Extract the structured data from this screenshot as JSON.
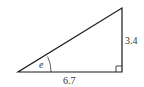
{
  "diagram": {
    "type": "right-triangle",
    "vertices": {
      "left": [
        18,
        72
      ],
      "right_angle": [
        122,
        72
      ],
      "top": [
        122,
        8
      ]
    },
    "stroke_color": "#1a1a1a",
    "labels": {
      "angle": "e",
      "base": "6.7",
      "height": "3.4"
    }
  }
}
